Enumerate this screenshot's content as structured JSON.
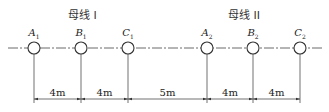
{
  "titles": [
    {
      "text": "母线 I",
      "x": 82
    },
    {
      "text": "母线 II",
      "x": 243
    }
  ],
  "centerline_y": 48,
  "circle_radius": 6,
  "nodes": [
    {
      "label": "A",
      "sub": "1",
      "x": 34
    },
    {
      "label": "B",
      "sub": "1",
      "x": 81
    },
    {
      "label": "C",
      "sub": "1",
      "x": 128
    },
    {
      "label": "A",
      "sub": "2",
      "x": 207
    },
    {
      "label": "B",
      "sub": "2",
      "x": 253
    },
    {
      "label": "C",
      "sub": "2",
      "x": 300
    }
  ],
  "dimensions": [
    {
      "text": "4m",
      "from": 34,
      "to": 81
    },
    {
      "text": "4m",
      "from": 81,
      "to": 128
    },
    {
      "text": "5m",
      "from": 128,
      "to": 207
    },
    {
      "text": "4m",
      "from": 207,
      "to": 253
    },
    {
      "text": "4m",
      "from": 253,
      "to": 300
    }
  ],
  "dimension_line_y": 99,
  "colors": {
    "line": "#333333",
    "text": "#222222"
  }
}
